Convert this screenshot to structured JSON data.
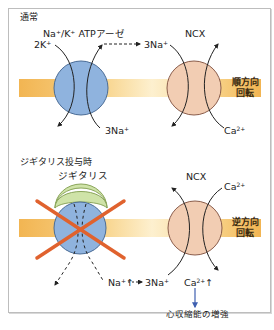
{
  "colors": {
    "membrane_dark": "#f2b552",
    "membrane_light": "#fbe6b5",
    "pump_fill": "#8fb3de",
    "pump_stroke": "#4a6c96",
    "ncx_fill": "#f2cdb3",
    "ncx_stroke": "#8a5c4a",
    "digitalis_fill": "#cfe3a8",
    "digitalis_stroke": "#8aa55a",
    "cross": "#e0622e",
    "arrow_blue": "#3e5fb0"
  },
  "normal": {
    "section_title": "通常",
    "pump_label": "Na⁺/K⁺ ATPアーゼ",
    "k_in": "2K",
    "k_in_sup": "+",
    "na_out_top": "3Na",
    "na_out_top_sup": "+",
    "na_bottom": "3Na",
    "na_bottom_sup": "+",
    "ncx_label": "NCX",
    "ca_bottom": "Ca",
    "ca_bottom_sup": "2+",
    "rotation_line1": "順方向",
    "rotation_line2": "回転"
  },
  "digitalis": {
    "section_title": "ジギタリス投与時",
    "drug_label": "ジギタリス",
    "ncx_label": "NCX",
    "ca_top": "Ca",
    "ca_top_sup": "2+",
    "na_increase": "Na",
    "na_increase_sup": "+",
    "na_increase_arrow": "↑",
    "na_3": "3Na",
    "na_3_sup": "+",
    "ca_increase": "Ca",
    "ca_increase_sup": "2+",
    "ca_increase_arrow": "↑",
    "rotation_line1": "逆方向",
    "rotation_line2": "回転",
    "outcome": "心収縮能の増強"
  }
}
